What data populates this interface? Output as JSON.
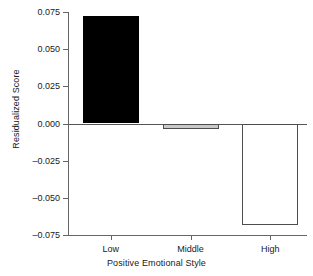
{
  "chart_data": {
    "type": "bar",
    "title": "",
    "xlabel": "Positive Emotional Style",
    "ylabel": "Residualized Score",
    "categories": [
      "Low",
      "Middle",
      "High"
    ],
    "values": [
      0.072,
      -0.004,
      -0.068
    ],
    "ylim": [
      -0.075,
      0.075
    ],
    "yticks": [
      0.075,
      0.05,
      0.025,
      0.0,
      -0.025,
      -0.05,
      -0.075
    ],
    "ytick_labels": [
      "0.075",
      "0.050",
      "0.025",
      "0.000",
      "–0.025",
      "–0.050",
      "–0.075"
    ],
    "grid": false,
    "legend": null,
    "bar_styles": [
      {
        "fill": "#000000",
        "border": "#000000"
      },
      {
        "fill": "#c9c9c9",
        "border": "#4d4d4d"
      },
      {
        "fill": "#ffffff",
        "border": "#4d4d4d"
      }
    ],
    "axis_color": "#666666",
    "background": "#ffffff"
  },
  "axes": {
    "y_title": "Residualized Score",
    "x_title": "Positive Emotional Style"
  },
  "ytick_items": [
    {
      "label": "0.075",
      "value": 0.075
    },
    {
      "label": "0.050",
      "value": 0.05
    },
    {
      "label": "0.025",
      "value": 0.025
    },
    {
      "label": "0.000",
      "value": 0.0
    },
    {
      "label": "–0.025",
      "value": -0.025
    },
    {
      "label": "–0.050",
      "value": -0.05
    },
    {
      "label": "–0.075",
      "value": -0.075
    }
  ],
  "xtick_items": [
    {
      "label": "Low",
      "value": 0.072
    },
    {
      "label": "Middle",
      "value": -0.004
    },
    {
      "label": "High",
      "value": -0.068
    }
  ]
}
